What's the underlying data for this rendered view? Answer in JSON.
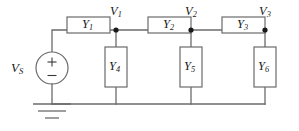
{
  "figure": {
    "type": "circuit-schematic",
    "width": 299,
    "height": 131,
    "colors": {
      "background": "#ffffff",
      "wire": "#6b6b6b",
      "box_stroke": "#6b6b6b",
      "box_fill": "#ffffff",
      "node_dot": "#1a1a1a",
      "label_text": "#1a1a1a"
    }
  },
  "source": {
    "name": "independent-voltage-source",
    "label": "V",
    "label_sub": "S",
    "plus_sign": "+",
    "minus_sign": "−",
    "polarity": "plus-on-top"
  },
  "ground": {
    "name": "ground-reference",
    "symbol": "earth-ground",
    "bars": 2
  },
  "series_branches": [
    {
      "id": "Y1",
      "label": "Y",
      "label_sub": "1",
      "position": "series-left"
    },
    {
      "id": "Y2",
      "label": "Y",
      "label_sub": "2",
      "position": "series-middle"
    },
    {
      "id": "Y3",
      "label": "Y",
      "label_sub": "3",
      "position": "series-right"
    }
  ],
  "shunt_branches": [
    {
      "id": "Y4",
      "label": "Y",
      "label_sub": "4",
      "position": "shunt-at-node-1"
    },
    {
      "id": "Y5",
      "label": "Y",
      "label_sub": "5",
      "position": "shunt-at-node-2"
    },
    {
      "id": "Y6",
      "label": "Y",
      "label_sub": "6",
      "position": "shunt-at-node-3"
    }
  ],
  "nodes": [
    {
      "id": "V1",
      "label": "V",
      "label_sub": "1"
    },
    {
      "id": "V2",
      "label": "V",
      "label_sub": "2"
    },
    {
      "id": "V3",
      "label": "V",
      "label_sub": "3"
    }
  ]
}
